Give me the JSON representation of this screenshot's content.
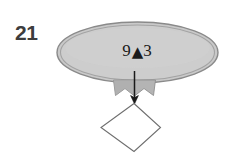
{
  "figure": {
    "number_label": "21",
    "background_color": "#ffffff"
  },
  "diagram": {
    "nodes": [
      {
        "id": "ellipse-node",
        "shape": "ellipse",
        "label_left": "9",
        "label_symbol": "▲",
        "label_right": "3",
        "full_label": "9▲3",
        "fill_color": "#c9c9c9",
        "stroke_color": "#8a8a8a",
        "inner_stroke_color": "#9d9d9d",
        "text_color": "#1a1a1a"
      },
      {
        "id": "diamond-node",
        "shape": "diamond",
        "label": "",
        "fill_color": "#ffffff",
        "stroke_color": "#6e6e6e"
      }
    ],
    "connector": {
      "id": "down-arrow",
      "type": "arrow",
      "direction": "down",
      "from": "ellipse-node",
      "to": "diamond-node",
      "color": "#1a1a1a"
    },
    "banner": {
      "id": "ribbon-shape",
      "fill_color": "#b4b4b4",
      "stroke_color": "#8f8f8f"
    }
  }
}
